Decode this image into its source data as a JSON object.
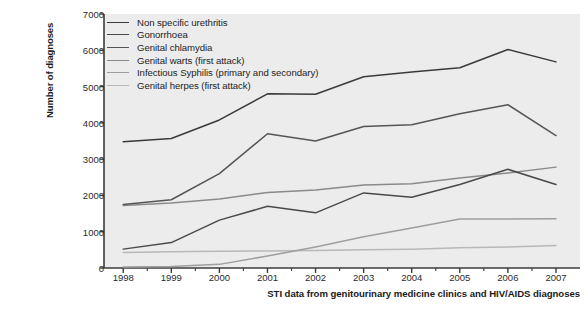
{
  "chart_data": {
    "type": "line",
    "title": "",
    "caption": "STI data from genitourinary medicine clinics and HIV/AIDS diagnoses",
    "xlabel": "",
    "ylabel": "Number of diagnoses",
    "categories": [
      "1998",
      "1999",
      "2000",
      "2001",
      "2002",
      "2003",
      "2004",
      "2005",
      "2006",
      "2007"
    ],
    "x": [
      1998,
      1999,
      2000,
      2001,
      2002,
      2003,
      2004,
      2005,
      2006,
      2007
    ],
    "xlim": [
      1997.6,
      2007.5
    ],
    "ylim": [
      0,
      7000
    ],
    "ytick_labels": [
      "0",
      "1000",
      "2000",
      "3000",
      "4000",
      "5000",
      "6000",
      "7000"
    ],
    "ytick_values": [
      0,
      1000,
      2000,
      3000,
      4000,
      5000,
      6000,
      7000
    ],
    "grid": false,
    "legend_position": "top-left",
    "plot_background": "#ececec",
    "axis_color": "#3c3c3c",
    "series": [
      {
        "name": "Non specific urethritis",
        "color": "#3a3a3a",
        "values": [
          3480,
          3570,
          4080,
          4800,
          4790,
          5270,
          5400,
          5520,
          6020,
          5680
        ]
      },
      {
        "name": "Gonorrhoea",
        "color": "#4a4a4a",
        "values": [
          520,
          700,
          1320,
          1700,
          1520,
          2070,
          1950,
          2300,
          2720,
          2300
        ]
      },
      {
        "name": "Genital chlamydia",
        "color": "#555555",
        "values": [
          1750,
          1880,
          2600,
          3700,
          3500,
          3900,
          3950,
          4250,
          4500,
          3650
        ]
      },
      {
        "name": "Genital warts (first attack)",
        "color": "#8a8a8a",
        "values": [
          1720,
          1790,
          1900,
          2080,
          2150,
          2290,
          2320,
          2480,
          2620,
          2780
        ]
      },
      {
        "name": "Infectious Syphilis (primary and secondary)",
        "color": "#9e9e9e",
        "values": [
          30,
          40,
          100,
          330,
          580,
          860,
          1100,
          1350,
          1350,
          1360
        ]
      },
      {
        "name": "Genital herpes (first attack)",
        "color": "#b8b8b8",
        "values": [
          430,
          450,
          460,
          470,
          480,
          500,
          520,
          560,
          580,
          620
        ]
      }
    ]
  },
  "legend": {
    "items": [
      "Non specific urethritis",
      "Gonorrhoea",
      "Genital chlamydia",
      "Genital warts (first attack)",
      "Infectious Syphilis (primary and secondary)",
      "Genital herpes (first attack)"
    ]
  }
}
